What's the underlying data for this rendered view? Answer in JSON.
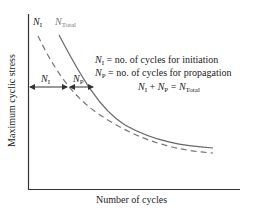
{
  "diagram": {
    "axes": {
      "ylabel": "Maximum cyclic stress",
      "xlabel": "Number of cycles"
    },
    "curves": [
      {
        "name": "N_I",
        "label_main": "N",
        "label_sub": "I",
        "style": "dashed",
        "color": "#777777"
      },
      {
        "name": "N_Total",
        "label_main": "N",
        "label_sub": "Total",
        "style": "solid",
        "color": "#777777"
      }
    ],
    "intervals": [
      {
        "label_main": "N",
        "label_sub": "I"
      },
      {
        "label_main": "N",
        "label_sub": "P"
      }
    ],
    "legend": {
      "line1": {
        "sym_main": "N",
        "sym_sub": "I",
        "text": " = no. of cycles for initiation"
      },
      "line2": {
        "sym_main": "N",
        "sym_sub": "P",
        "text": " = no. of cycles for propagation"
      },
      "equation": {
        "a_main": "N",
        "a_sub": "I",
        "plus": " + ",
        "b_main": "N",
        "b_sub": "P",
        "eq": " = ",
        "c_main": "N",
        "c_sub": "Total"
      }
    }
  }
}
